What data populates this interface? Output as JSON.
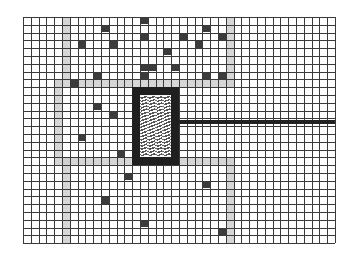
{
  "board": {
    "origin": [
      23,
      17
    ],
    "cell_size": 7.8,
    "cols": 40,
    "rows": 29,
    "colors": {
      "background": "#ffffff",
      "grid_line": "#3a3a3a",
      "band": "#cfcfcf",
      "block": "#3b3b3b",
      "frame": "#1f1f1f",
      "bar": "#222222"
    },
    "bands": [
      {
        "name": "left-wall-top",
        "col": 5,
        "row": 0,
        "w": 1,
        "h": 8
      },
      {
        "name": "left-wall-mid",
        "col": 4,
        "row": 8,
        "w": 1,
        "h": 10
      },
      {
        "name": "left-wall-bottom",
        "col": 5,
        "row": 18,
        "w": 1,
        "h": 11
      },
      {
        "name": "corridor-top",
        "col": 4,
        "row": 8,
        "w": 23,
        "h": 1
      },
      {
        "name": "corridor-bottom",
        "col": 4,
        "row": 18,
        "w": 23,
        "h": 1
      },
      {
        "name": "right-wall-top",
        "col": 26,
        "row": 0,
        "w": 1,
        "h": 9
      },
      {
        "name": "right-wall-bottom",
        "col": 26,
        "row": 18,
        "w": 1,
        "h": 11
      }
    ],
    "blocks": [
      [
        15,
        0
      ],
      [
        10,
        1
      ],
      [
        23,
        1
      ],
      [
        7,
        3
      ],
      [
        15,
        2
      ],
      [
        20,
        2
      ],
      [
        25,
        2
      ],
      [
        11,
        3
      ],
      [
        22,
        3
      ],
      [
        18,
        4
      ],
      [
        15,
        6
      ],
      [
        16,
        6
      ],
      [
        15,
        7
      ],
      [
        19,
        6
      ],
      [
        23,
        7
      ],
      [
        25,
        7
      ],
      [
        9,
        7
      ],
      [
        6,
        8
      ],
      [
        9,
        11
      ],
      [
        11,
        12
      ],
      [
        7,
        15
      ],
      [
        12,
        17
      ],
      [
        13,
        20
      ],
      [
        23,
        21
      ],
      [
        10,
        23
      ],
      [
        15,
        26
      ],
      [
        25,
        27
      ]
    ],
    "chamber": {
      "frame": {
        "col": 14,
        "row": 9,
        "w": 6,
        "h": 10
      },
      "inner": {
        "col": 15,
        "row": 10,
        "w": 4,
        "h": 8
      }
    },
    "bar": {
      "col": 20,
      "row": 13,
      "w": 20,
      "h": 0.6
    }
  }
}
